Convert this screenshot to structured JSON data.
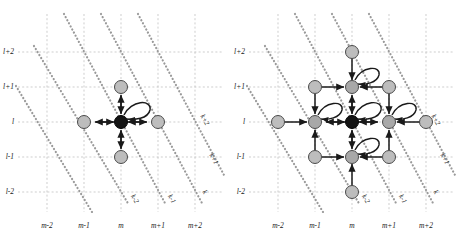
{
  "figure": {
    "type": "diagram",
    "grid": {
      "x_labels": [
        "m-2",
        "m-1",
        "m",
        "m+1",
        "m+2"
      ],
      "y_labels": [
        "l+2",
        "l+1",
        "l",
        "l-1",
        "l-2"
      ],
      "diagonal_labels": [
        "k+2",
        "k+1",
        "k",
        "k-1",
        "k-2"
      ],
      "x_positions": [
        47,
        84,
        121,
        158,
        195
      ],
      "y_positions": [
        52,
        87,
        122,
        157,
        192
      ],
      "gridline_color": "#b9b9b9",
      "diagonal_color": "#9a9a9a"
    },
    "colors": {
      "center_node": "#141414",
      "neighbor_node": "#bdbdbd",
      "node_stroke": "#333333",
      "arrow": "#1a1a1a",
      "background": "#ffffff"
    },
    "panels": [
      {
        "id": "left",
        "name": "single-site-transitions",
        "center_node": {
          "x": "m",
          "y": "l",
          "fill": "center_node"
        },
        "neighbor_nodes": [
          {
            "x": "m",
            "y": "l+1",
            "fill": "neighbor_node"
          },
          {
            "x": "m",
            "y": "l-1",
            "fill": "neighbor_node"
          },
          {
            "x": "m-1",
            "y": "l",
            "fill": "neighbor_node"
          },
          {
            "x": "m+1",
            "y": "l",
            "fill": "neighbor_node"
          }
        ],
        "arrows": [
          {
            "from": "m,l",
            "to": "m,l+1",
            "double": true
          },
          {
            "from": "m,l",
            "to": "m,l-1",
            "double": true
          },
          {
            "from": "m,l",
            "to": "m-1,l",
            "double": true
          },
          {
            "from": "m,l",
            "to": "m+1,l",
            "double": true
          }
        ],
        "self_loops": [
          {
            "at": "m,l",
            "direction": "upper-right"
          }
        ]
      },
      {
        "id": "right",
        "name": "extended-neighbourhood-transitions",
        "center_node": {
          "x": "m",
          "y": "l",
          "fill": "center_node"
        },
        "neighbor_nodes": [
          {
            "x": "m",
            "y": "l+2",
            "fill": "neighbor_node"
          },
          {
            "x": "m",
            "y": "l-2",
            "fill": "neighbor_node"
          },
          {
            "x": "m-2",
            "y": "l",
            "fill": "neighbor_node"
          },
          {
            "x": "m+2",
            "y": "l",
            "fill": "neighbor_node"
          },
          {
            "x": "m-1",
            "y": "l+1",
            "fill": "neighbor_node"
          },
          {
            "x": "m",
            "y": "l+1",
            "fill": "neighbor_node"
          },
          {
            "x": "m+1",
            "y": "l+1",
            "fill": "neighbor_node"
          },
          {
            "x": "m-1",
            "y": "l",
            "fill": "neighbor_node"
          },
          {
            "x": "m+1",
            "y": "l",
            "fill": "neighbor_node"
          },
          {
            "x": "m-1",
            "y": "l-1",
            "fill": "neighbor_node"
          },
          {
            "x": "m",
            "y": "l-1",
            "fill": "neighbor_node"
          },
          {
            "x": "m+1",
            "y": "l-1",
            "fill": "neighbor_node"
          }
        ],
        "self_loops": [
          {
            "at": "m,l",
            "direction": "upper-right"
          },
          {
            "at": "m-1,l",
            "direction": "upper-right"
          },
          {
            "at": "m+1,l",
            "direction": "upper-right"
          },
          {
            "at": "m,l+1",
            "direction": "upper-right"
          },
          {
            "at": "m,l-1",
            "direction": "upper-right"
          }
        ]
      }
    ]
  }
}
